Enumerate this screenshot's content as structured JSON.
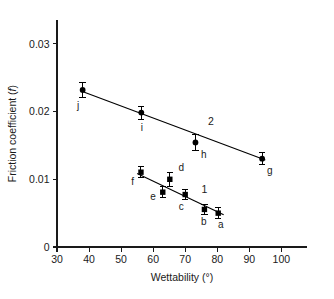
{
  "chart_data": {
    "type": "scatter",
    "title": "",
    "xlabel": "Wettability (°)",
    "ylabel": "Friction coefficient (f)",
    "ylabel_prefix": "Friction coefficient (",
    "ylabel_italic": "f",
    "ylabel_suffix": ")",
    "xlim": [
      30,
      108
    ],
    "ylim": [
      0,
      0.0335
    ],
    "xticks": [
      30,
      40,
      50,
      60,
      70,
      80,
      90,
      100
    ],
    "xticklabels": [
      "30",
      "40",
      "50",
      "60",
      "70",
      "80",
      "90",
      "100"
    ],
    "yticks": [
      0,
      0.01,
      0.02,
      0.03
    ],
    "yticklabels": [
      "0",
      "0.01",
      "0.02",
      "0.03"
    ],
    "grid": false,
    "legend": "none",
    "series": [
      {
        "name": "1",
        "marker": "square",
        "label_text": "1",
        "label_x": 76.0,
        "label_y": 0.00855,
        "fit_line": {
          "x0": 55.0,
          "y0": 0.01085,
          "x1": 82.0,
          "y1": 0.00475
        },
        "points": [
          {
            "id": "a",
            "x": 80.3,
            "y": 0.005,
            "yerr": 0.00085,
            "label_dx": 0.8,
            "label_dy": -0.00175
          },
          {
            "id": "b",
            "x": 76.0,
            "y": 0.00555,
            "yerr": 0.00075,
            "label_dx": -0.2,
            "label_dy": -0.00175
          },
          {
            "id": "c",
            "x": 70.0,
            "y": 0.00775,
            "yerr": 0.0008,
            "label_dx": -1.2,
            "label_dy": -0.00175
          },
          {
            "id": "d",
            "x": 65.2,
            "y": 0.01,
            "yerr": 0.00105,
            "label_dx": 3.6,
            "label_dy": 0.00175
          },
          {
            "id": "e",
            "x": 63.0,
            "y": 0.0081,
            "yerr": 0.0008,
            "label_dx": -3.0,
            "label_dy": -0.0006
          },
          {
            "id": "f",
            "x": 56.2,
            "y": 0.01105,
            "yerr": 0.0008,
            "label_dx": -2.6,
            "label_dy": -0.00135
          }
        ]
      },
      {
        "name": "2",
        "marker": "circle",
        "label_text": "2",
        "label_x": 78.0,
        "label_y": 0.01855,
        "fit_line": {
          "x0": 37.5,
          "y0": 0.02305,
          "x1": 95.0,
          "y1": 0.01285
        },
        "points": [
          {
            "id": "g",
            "x": 94.0,
            "y": 0.01305,
            "yerr": 0.00085,
            "label_dx": 2.4,
            "label_dy": -0.00175
          },
          {
            "id": "h",
            "x": 73.2,
            "y": 0.01545,
            "yerr": 0.00115,
            "label_dx": 2.6,
            "label_dy": -0.00175
          },
          {
            "id": "i",
            "x": 56.3,
            "y": 0.01985,
            "yerr": 0.00095,
            "label_dx": 0.2,
            "label_dy": -0.00215
          },
          {
            "id": "j",
            "x": 38.0,
            "y": 0.0232,
            "yerr": 0.00115,
            "label_dx": -1.4,
            "label_dy": -0.00225
          }
        ]
      }
    ]
  },
  "figure": {
    "background_color": "#ffffff",
    "axis_color": "#1a1a1a",
    "marker_color": "#000000"
  }
}
